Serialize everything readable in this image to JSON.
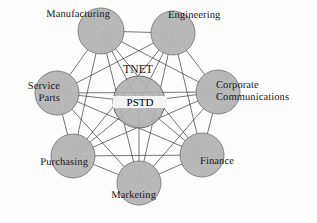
{
  "diagram": {
    "type": "network-graph",
    "title_label": "TNET",
    "hub_label": "PSTD",
    "canvas": {
      "width": 317,
      "height": 223
    },
    "colors": {
      "background": "#fdfdfd",
      "node_fill": "#b6b6b6",
      "node_stroke": "#6d6d6d",
      "edge_stroke": "#3a3a3a",
      "label_text": "#141414"
    },
    "hub": {
      "id": "pstd",
      "label": "PSTD",
      "cx": 139,
      "cy": 102,
      "r": 26
    },
    "network_label": {
      "text": "TNET",
      "x": 138,
      "y": 70
    },
    "nodes": [
      {
        "id": "manufacturing",
        "label": "Manufacturing",
        "cx": 101,
        "cy": 31,
        "r": 23,
        "label_x": 18,
        "label_y": 9,
        "label_w": 92,
        "align": "lbl-right",
        "lines": [
          "Manufacturing"
        ]
      },
      {
        "id": "engineering",
        "label": "Engineering",
        "cx": 173,
        "cy": 33,
        "r": 22,
        "label_x": 168,
        "label_y": 10,
        "label_w": 86,
        "align": "lbl-left",
        "lines": [
          "Engineering"
        ]
      },
      {
        "id": "corporate-communications",
        "label": "Corporate Communications",
        "cx": 218,
        "cy": 92,
        "r": 22,
        "label_x": 216,
        "label_y": 80,
        "label_w": 101,
        "align": "lbl-left",
        "lines": [
          "Corporate",
          "Communications"
        ]
      },
      {
        "id": "finance",
        "label": "Finance",
        "cx": 202,
        "cy": 155,
        "r": 22,
        "label_x": 200,
        "label_y": 156,
        "label_w": 70,
        "align": "lbl-left",
        "lines": [
          "Finance"
        ]
      },
      {
        "id": "marketing",
        "label": "Marketing",
        "cx": 139,
        "cy": 183,
        "r": 22,
        "label_x": 84,
        "label_y": 190,
        "label_w": 72,
        "align": "lbl-right",
        "lines": [
          "Marketing"
        ]
      },
      {
        "id": "purchasing",
        "label": "Purchasing",
        "cx": 73,
        "cy": 156,
        "r": 22,
        "label_x": 10,
        "label_y": 157,
        "label_w": 78,
        "align": "lbl-right",
        "lines": [
          "Purchasing"
        ]
      },
      {
        "id": "service-parts",
        "label": "Service Parts",
        "cx": 57,
        "cy": 93,
        "r": 22,
        "label_x": 2,
        "label_y": 81,
        "label_w": 58,
        "align": "lbl-right",
        "lines": [
          "Service",
          "Parts"
        ]
      },
      {
        "id": "engineering-spacer",
        "label": "",
        "cx": -100,
        "cy": -100,
        "r": 0,
        "label_x": -999,
        "label_y": -999,
        "label_w": 0,
        "align": "lbl-left",
        "lines": []
      }
    ]
  }
}
